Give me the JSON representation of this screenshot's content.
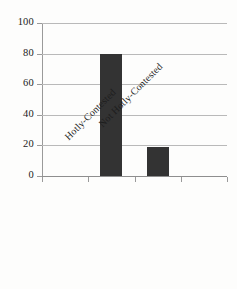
{
  "chart_data": {
    "type": "bar",
    "title": "",
    "subtitle": "",
    "xlabel": "",
    "ylabel": "",
    "categories": [
      "Hotly-Contested",
      "Not Hotly-Contested"
    ],
    "values": [
      80,
      19
    ],
    "series": [
      {
        "name": "",
        "values": [
          80,
          19
        ]
      }
    ],
    "ylim": [
      0,
      100
    ],
    "yticks": [
      0,
      20,
      40,
      60,
      80,
      100
    ],
    "ytick_labels": [
      "0",
      "20",
      "40",
      "60",
      "80",
      "100"
    ],
    "grid": "horizontal",
    "legend": "none",
    "bar_color": "#333333",
    "gridline_color": "#b9b9b9",
    "axis_color": "#9a9a9a",
    "label_rotation": -45
  }
}
